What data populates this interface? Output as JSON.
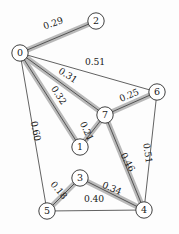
{
  "figure": {
    "title": "",
    "background": "#fdfdfd",
    "node_fill": "#ffffff",
    "node_stroke": "#2b2b2b",
    "edge_color": "#3a3a3a",
    "highlight_color": "#b9b9b9",
    "node_radius": 8.2
  },
  "chart_data": {
    "type": "diagram",
    "subtype": "weighted-graph-mst",
    "title": "",
    "xlabel": "",
    "ylabel": "",
    "grid": false,
    "legend": null,
    "nodes": [
      {
        "id": "0",
        "label": "0",
        "x": 20,
        "y": 53
      },
      {
        "id": "1",
        "label": "1",
        "x": 80,
        "y": 147
      },
      {
        "id": "2",
        "label": "2",
        "x": 96,
        "y": 21
      },
      {
        "id": "3",
        "label": "3",
        "x": 80,
        "y": 178
      },
      {
        "id": "4",
        "label": "4",
        "x": 144,
        "y": 210
      },
      {
        "id": "5",
        "label": "5",
        "x": 47,
        "y": 211
      },
      {
        "id": "6",
        "label": "6",
        "x": 157,
        "y": 92
      },
      {
        "id": "7",
        "label": "7",
        "x": 105,
        "y": 115
      }
    ],
    "edges": [
      {
        "source": "0",
        "target": "2",
        "weight": "0.29",
        "highlighted": true,
        "label_x": 53,
        "label_y": 23,
        "label_rot": -19
      },
      {
        "source": "0",
        "target": "6",
        "weight": "0.51",
        "highlighted": false,
        "label_x": 95,
        "label_y": 62,
        "label_rot": 0
      },
      {
        "source": "0",
        "target": "7",
        "weight": "0.31",
        "highlighted": true,
        "label_x": 68,
        "label_y": 75,
        "label_rot": 33
      },
      {
        "source": "0",
        "target": "1",
        "weight": "0.32",
        "highlighted": true,
        "label_x": 59,
        "label_y": 95,
        "label_rot": 57
      },
      {
        "source": "0",
        "target": "5",
        "weight": "0.60",
        "highlighted": false,
        "label_x": 36,
        "label_y": 131,
        "label_rot": 79
      },
      {
        "source": "7",
        "target": "6",
        "weight": "0.25",
        "highlighted": true,
        "label_x": 129,
        "label_y": 95,
        "label_rot": -23
      },
      {
        "source": "7",
        "target": "1",
        "weight": "0.21",
        "highlighted": true,
        "label_x": 87,
        "label_y": 131,
        "label_rot": 66
      },
      {
        "source": "7",
        "target": "4",
        "weight": "0.46",
        "highlighted": true,
        "label_x": 128,
        "label_y": 162,
        "label_rot": 62
      },
      {
        "source": "6",
        "target": "4",
        "weight": "0.51",
        "highlighted": false,
        "label_x": 148,
        "label_y": 153,
        "label_rot": 82
      },
      {
        "source": "3",
        "target": "4",
        "weight": "0.34",
        "highlighted": true,
        "label_x": 112,
        "label_y": 188,
        "label_rot": 23
      },
      {
        "source": "5",
        "target": "3",
        "weight": "0.18",
        "highlighted": true,
        "label_x": 59,
        "label_y": 190,
        "label_rot": 50
      },
      {
        "source": "5",
        "target": "4",
        "weight": "0.40",
        "highlighted": false,
        "label_x": 94,
        "label_y": 199,
        "label_rot": 0
      }
    ]
  }
}
